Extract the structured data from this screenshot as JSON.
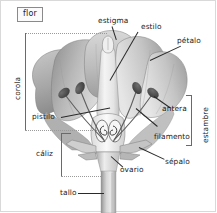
{
  "figure": {
    "title": "flor",
    "language": "es",
    "style": "grayscale-botanical-illustration"
  },
  "labels": {
    "estigma": "estigma",
    "estilo": "estilo",
    "petalo": "pétalo",
    "antera": "antera",
    "filamento": "filamento",
    "sepalo": "sépalo",
    "ovario": "ovario",
    "tallo": "tallo",
    "pistilo": "pistilo",
    "caliz": "cáliz",
    "corola": "corola",
    "estambre": "estambre"
  },
  "groups": {
    "corola_bracket": "corola",
    "caliz_bracket": "cáliz",
    "estambre_bracket": "estambre"
  },
  "colors": {
    "background": "#ffffff",
    "border": "#d9d9d9",
    "text": "#1a1a1a",
    "leader_line": "#2a2a2a",
    "bracket_dotted": "#9a9a9a",
    "bracket_solid": "#6a6a6a",
    "petal_light": "#e8e8e8",
    "petal_mid": "#bdbdbd",
    "petal_dark": "#8f8f8f",
    "anther_dark": "#4a4a4a",
    "pistil_light": "#f0f0f0",
    "stem_gray": "#b8b8b8"
  }
}
